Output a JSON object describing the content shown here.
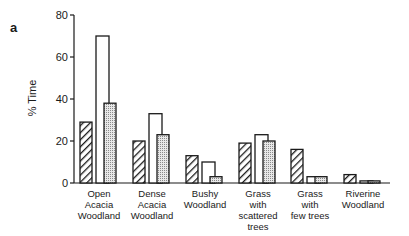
{
  "panel_label": "a",
  "chart_data": {
    "type": "bar",
    "title": "",
    "xlabel": "",
    "ylabel": "% Time",
    "ylim": [
      0,
      80
    ],
    "yticks": [
      0,
      20,
      40,
      60,
      80
    ],
    "grid": false,
    "legend": null,
    "categories": [
      "Open Acacia Woodland",
      "Dense Acacia Woodland",
      "Bushy Woodland",
      "Grass with scattered trees",
      "Grass with few trees",
      "Riverine Woodland"
    ],
    "category_label_lines": [
      [
        "Open",
        "Acacia",
        "Woodland"
      ],
      [
        "Dense",
        "Acacia",
        "Woodland"
      ],
      [
        "Bushy",
        "Woodland"
      ],
      [
        "Grass",
        "with",
        "scattered",
        "trees"
      ],
      [
        "Grass",
        "with",
        "few trees"
      ],
      [
        "Riverine",
        "Woodland"
      ]
    ],
    "series": [
      {
        "name": "hatched",
        "pattern": "diagonal-hatch",
        "values": [
          29,
          20,
          13,
          19,
          16,
          4
        ]
      },
      {
        "name": "open",
        "pattern": "white",
        "values": [
          70,
          33,
          10,
          23,
          3,
          1
        ]
      },
      {
        "name": "stippled",
        "pattern": "dotted",
        "values": [
          38,
          23,
          3,
          20,
          3,
          1
        ]
      }
    ]
  }
}
